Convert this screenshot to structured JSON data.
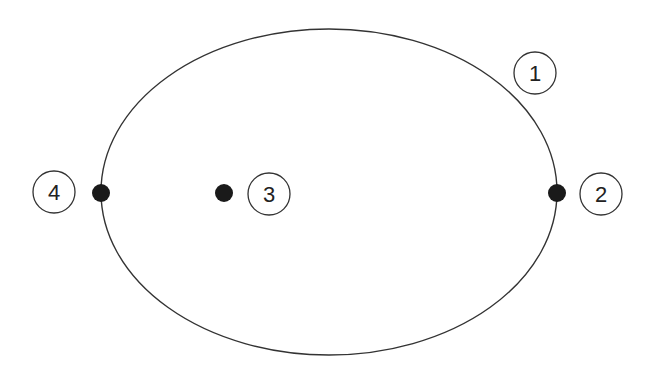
{
  "diagram": {
    "type": "ellipse-orbit-points",
    "ellipse": {
      "cx": 329,
      "cy": 192,
      "rx": 228,
      "ry": 163,
      "stroke": "#333333"
    },
    "points": [
      {
        "id": "point-2",
        "cx": 557,
        "cy": 193,
        "r": 9,
        "fill": "#1a1a1a"
      },
      {
        "id": "point-3",
        "cx": 224,
        "cy": 193,
        "r": 9,
        "fill": "#1a1a1a"
      },
      {
        "id": "point-4",
        "cx": 101,
        "cy": 193,
        "r": 9,
        "fill": "#1a1a1a"
      }
    ],
    "labels": [
      {
        "id": "label-1",
        "text": "1",
        "cx": 535,
        "cy": 73,
        "r": 22
      },
      {
        "id": "label-2",
        "text": "2",
        "cx": 601,
        "cy": 194,
        "r": 22
      },
      {
        "id": "label-3",
        "text": "3",
        "cx": 269,
        "cy": 194,
        "r": 22
      },
      {
        "id": "label-4",
        "text": "4",
        "cx": 54,
        "cy": 192,
        "r": 22
      }
    ]
  }
}
